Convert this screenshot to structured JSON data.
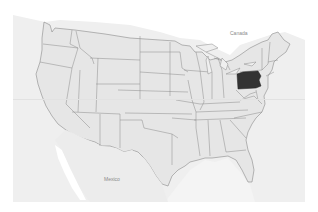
{
  "map": {
    "title": "United States map",
    "highlighted_state": "Pennsylvania",
    "labels": {
      "canada": "Canada",
      "mexico": "Mexico"
    },
    "colors": {
      "background": "#ffffff",
      "water": "#efefef",
      "land": "#e6e6e6",
      "foreign_land": "#ededed",
      "border": "#8a8a8a",
      "highlight": "#333333",
      "label": "#8a8a8a"
    }
  }
}
